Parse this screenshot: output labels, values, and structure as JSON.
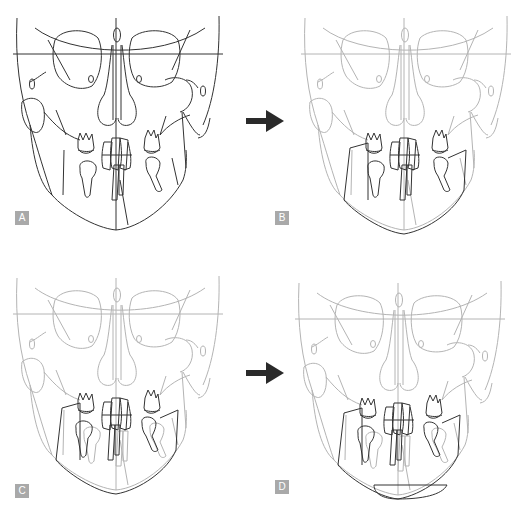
{
  "figure": {
    "panels": [
      {
        "label": "A",
        "stage": "baseline tracing",
        "highlight": "full skull dark"
      },
      {
        "label": "B",
        "stage": "mandible and teeth highlighted",
        "highlight": "mandible + dentition dark"
      },
      {
        "label": "C",
        "stage": "mandible repositioned",
        "highlight": "mandible + dentition dark, original ghosted"
      },
      {
        "label": "D",
        "stage": "genioplasty added",
        "highlight": "mandible + chin segment dark"
      }
    ],
    "arrows": [
      {
        "from": "A",
        "to": "B",
        "icon": "right-arrow-icon"
      },
      {
        "from": "C",
        "to": "D",
        "icon": "right-arrow-icon"
      }
    ],
    "colors": {
      "dark_line": "#333333",
      "light_line": "#b4b4b4",
      "arrow": "#2a2a2a",
      "badge_bg": "#a9a9a9",
      "badge_text": "#ffffff"
    }
  }
}
